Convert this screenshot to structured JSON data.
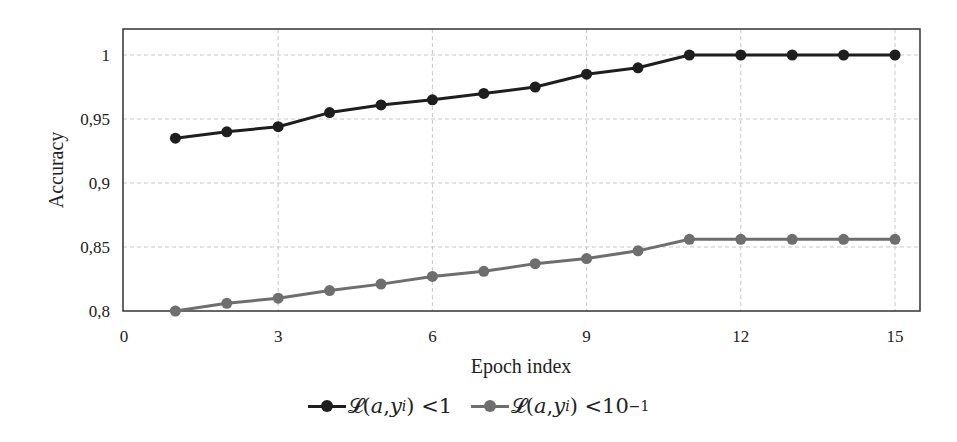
{
  "chart_data": {
    "type": "line",
    "title": "",
    "xlabel": "Epoch index",
    "ylabel": "Accuracy",
    "xlim": [
      0,
      15.5
    ],
    "ylim": [
      0.8,
      1.02
    ],
    "x_ticks": [
      0,
      3,
      6,
      9,
      12,
      15
    ],
    "x_tick_labels": [
      "0",
      "3",
      "6",
      "9",
      "12",
      "15"
    ],
    "y_ticks": [
      0.8,
      0.85,
      0.9,
      0.95,
      1.0
    ],
    "y_tick_labels": [
      "0,8",
      "0,85",
      "0,9",
      "0,95",
      "1"
    ],
    "grid": true,
    "legend_position": "bottom",
    "x": [
      1,
      2,
      3,
      4,
      5,
      6,
      7,
      8,
      9,
      10,
      11,
      12,
      13,
      14,
      15
    ],
    "series": [
      {
        "name": "𝓛(a, y_i) < 1",
        "color": "#1e1e1e",
        "values": [
          0.935,
          0.94,
          0.944,
          0.955,
          0.961,
          0.965,
          0.97,
          0.975,
          0.985,
          0.99,
          1.0,
          1.0,
          1.0,
          1.0,
          1.0
        ]
      },
      {
        "name": "𝓛(a, y_i) < 10^-1",
        "color": "#6e6e6e",
        "values": [
          0.8,
          0.806,
          0.81,
          0.816,
          0.821,
          0.827,
          0.831,
          0.837,
          0.841,
          0.847,
          0.856,
          0.856,
          0.856,
          0.856,
          0.856
        ]
      }
    ]
  },
  "legend": {
    "items": [
      {
        "prefix": "𝓛(",
        "a": "a",
        "sep": ", ",
        "y": "y",
        "sub": "i",
        "rel": ") < ",
        "rhs": "1",
        "sup": ""
      },
      {
        "prefix": "𝓛(",
        "a": "a",
        "sep": ", ",
        "y": "y",
        "sub": "i",
        "rel": ") < ",
        "rhs": "10",
        "sup": "−1"
      }
    ]
  }
}
